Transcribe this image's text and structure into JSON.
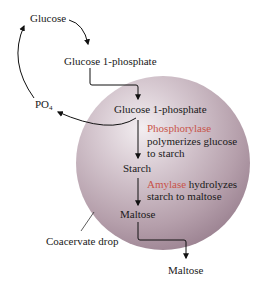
{
  "diagram": {
    "type": "flow",
    "title": "",
    "colors": {
      "sphere_light": "#efe8ec",
      "sphere_mid": "#c9b8c2",
      "sphere_dark": "#8f7684",
      "enzyme_text": "#c8544a",
      "arrow": "#111111",
      "text": "#1a1a1a"
    },
    "outside": {
      "glucose": "Glucose",
      "glucose_1p": "Glucose 1-phosphate",
      "po4_main": "PO",
      "po4_sub": "4",
      "maltose_out": "Maltose",
      "coacervate_label": "Coacervate drop"
    },
    "inside": {
      "glucose_1p": "Glucose 1-phosphate",
      "phosphorylase_enzyme": "Phosphorylase",
      "phosphorylase_line1": "polymerizes glucose",
      "phosphorylase_line2": "to starch",
      "starch": "Starch",
      "amylase_enzyme": "Amylase",
      "amylase_rest": " hydrolyzes",
      "amylase_line2": "starch to maltose",
      "maltose": "Maltose"
    },
    "nodes": [
      "Glucose",
      "Glucose 1-phosphate",
      "Glucose 1-phosphate (inside)",
      "Starch",
      "Maltose (inside)",
      "Maltose (outside)",
      "PO4"
    ],
    "edges": [
      {
        "from": "Glucose",
        "to": "Glucose 1-phosphate"
      },
      {
        "from": "Glucose 1-phosphate",
        "to": "Glucose 1-phosphate (inside)"
      },
      {
        "from": "Glucose 1-phosphate (inside)",
        "to": "Starch",
        "label": "Phosphorylase polymerizes glucose to starch"
      },
      {
        "from": "Glucose 1-phosphate (inside)",
        "to": "PO4"
      },
      {
        "from": "PO4",
        "to": "Glucose"
      },
      {
        "from": "Starch",
        "to": "Maltose (inside)",
        "label": "Amylase hydrolyzes starch to maltose"
      },
      {
        "from": "Maltose (inside)",
        "to": "Maltose (outside)"
      }
    ]
  }
}
